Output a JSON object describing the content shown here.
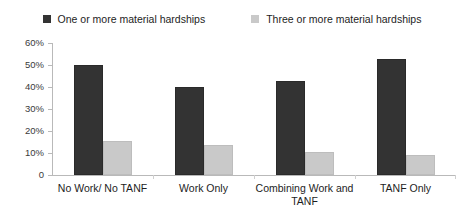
{
  "chart_data": {
    "type": "bar",
    "title": "",
    "subtitle": "",
    "xlabel": "",
    "ylabel": "",
    "ylim": [
      0,
      60
    ],
    "y_tick_labels": [
      "0",
      "10%",
      "20%",
      "30%",
      "40%",
      "50%",
      "60%"
    ],
    "y_ticks": [
      0,
      10,
      20,
      30,
      40,
      50,
      60
    ],
    "grid": false,
    "legend_position": "top-center",
    "categories": [
      "No Work/ No TANF",
      "Work Only",
      "Combining Work and TANF",
      "TANF Only"
    ],
    "category_lines": [
      [
        "No Work/ No TANF"
      ],
      [
        "Work Only"
      ],
      [
        "Combining Work and",
        "TANF"
      ],
      [
        "TANF Only"
      ]
    ],
    "series": [
      {
        "name": "One or more material hardships",
        "color": "#333333",
        "values": [
          50,
          40,
          42.5,
          52.5
        ]
      },
      {
        "name": "Three or more material hardships",
        "color": "#c9c9c9",
        "values": [
          15.5,
          13.5,
          10.5,
          9
        ]
      }
    ]
  },
  "legend": {
    "entries": [
      {
        "label": "One or more material hardships"
      },
      {
        "label": "Three or more material hardships"
      }
    ]
  },
  "axis": {
    "y_labels": [
      "60%",
      "50%",
      "40%",
      "30%",
      "20%",
      "10%",
      "0"
    ]
  }
}
